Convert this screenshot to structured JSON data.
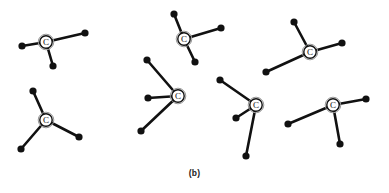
{
  "figure": {
    "caption": "(b)",
    "width": 389,
    "height": 193,
    "background_color": "#ffffff",
    "ink_color": "#111111",
    "center_label_color": "#111111",
    "center_fill_color": "#ffffff"
  },
  "diagram_data": {
    "type": "node-link",
    "description": "Seven isolated carbon-centered units; each has a circled C center joined by straight bonds to three filled terminal dots.",
    "node_count": 7,
    "bonds_per_node": 3,
    "center_symbol": "C",
    "center_radius": 6.2,
    "terminal_dot_radius": 3.6,
    "bond_stroke_width": 2.6,
    "structures": [
      {
        "id": "structure-1",
        "name": "top-left-unit",
        "center": {
          "x": 46,
          "y": 42,
          "label": "C"
        },
        "terminals": [
          {
            "x": 22,
            "y": 46
          },
          {
            "x": 85,
            "y": 33
          },
          {
            "x": 53,
            "y": 66
          }
        ]
      },
      {
        "id": "structure-2",
        "name": "bottom-left-unit",
        "center": {
          "x": 46,
          "y": 120,
          "label": "C"
        },
        "terminals": [
          {
            "x": 33,
            "y": 91
          },
          {
            "x": 21,
            "y": 149
          },
          {
            "x": 79,
            "y": 137
          }
        ]
      },
      {
        "id": "structure-3",
        "name": "top-middle-unit",
        "center": {
          "x": 184,
          "y": 39,
          "label": "C"
        },
        "terminals": [
          {
            "x": 174,
            "y": 14
          },
          {
            "x": 221,
            "y": 28
          },
          {
            "x": 195,
            "y": 62
          }
        ]
      },
      {
        "id": "structure-4",
        "name": "center-middle-unit",
        "center": {
          "x": 178,
          "y": 96,
          "label": "C"
        },
        "terminals": [
          {
            "x": 147,
            "y": 60
          },
          {
            "x": 148,
            "y": 98
          },
          {
            "x": 141,
            "y": 131
          }
        ]
      },
      {
        "id": "structure-5",
        "name": "top-right-unit",
        "center": {
          "x": 310,
          "y": 52,
          "label": "C"
        },
        "terminals": [
          {
            "x": 294,
            "y": 22
          },
          {
            "x": 342,
            "y": 43
          },
          {
            "x": 266,
            "y": 72
          }
        ]
      },
      {
        "id": "structure-6",
        "name": "bottom-middle-unit",
        "center": {
          "x": 256,
          "y": 105,
          "label": "C"
        },
        "terminals": [
          {
            "x": 220,
            "y": 80
          },
          {
            "x": 236,
            "y": 118
          },
          {
            "x": 246,
            "y": 156
          }
        ]
      },
      {
        "id": "structure-7",
        "name": "bottom-right-unit",
        "center": {
          "x": 333,
          "y": 105,
          "label": "C"
        },
        "terminals": [
          {
            "x": 366,
            "y": 99
          },
          {
            "x": 288,
            "y": 124
          },
          {
            "x": 340,
            "y": 144
          }
        ]
      }
    ]
  }
}
